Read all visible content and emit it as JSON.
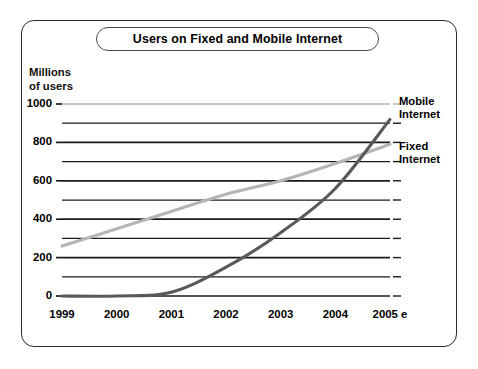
{
  "figure": {
    "title": "Users on Fixed and Mobile Internet",
    "y_axis_caption": "Millions\nof users"
  },
  "legend": {
    "mobile_label": "Mobile\nInternet",
    "fixed_label": "Fixed\nInternet"
  },
  "colors": {
    "mobile_line": "#595959",
    "fixed_line": "#b5b5b5",
    "gridline_major": "#1a1a1a",
    "gridline_top": "#8c8c8c",
    "frame": "#2a2a2a",
    "text": "#000000",
    "background": "#ffffff"
  },
  "chart_data": {
    "type": "line",
    "title": "Users on Fixed and Mobile Internet",
    "xlabel": "",
    "ylabel": "Millions of users",
    "x": [
      "1999",
      "2000",
      "2001",
      "2002",
      "2003",
      "2004",
      "2005 e"
    ],
    "xlim": [
      1999,
      2005
    ],
    "ylim": [
      0,
      1000
    ],
    "yticks": [
      0,
      200,
      400,
      600,
      800,
      1000
    ],
    "ytick_labels": [
      "0",
      "200",
      "400",
      "600",
      "800",
      "1000"
    ],
    "minor_gridlines": [
      100,
      300,
      500,
      700,
      900
    ],
    "grid": true,
    "legend_position": "right",
    "series": [
      {
        "name": "Fixed Internet",
        "color": "#b5b5b5",
        "values": [
          260,
          350,
          440,
          530,
          600,
          690,
          790
        ]
      },
      {
        "name": "Mobile Internet",
        "color": "#595959",
        "values": [
          0,
          0,
          20,
          150,
          330,
          560,
          920
        ]
      }
    ],
    "annotations": [
      "Mobile Internet line begins rising from 0 around late 2000",
      "Mobile Internet overtakes Fixed Internet around mid 2004"
    ]
  }
}
